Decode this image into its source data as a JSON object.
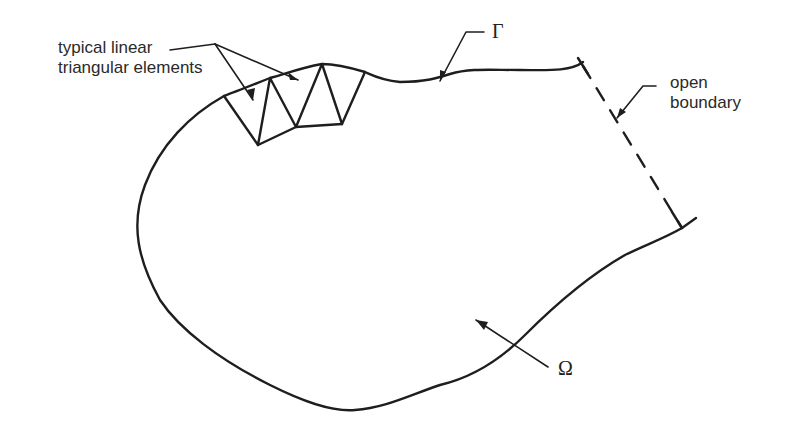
{
  "figure": {
    "labels": {
      "elements_line1": "typical linear",
      "elements_line2": "triangular elements",
      "open_line1": "open",
      "open_line2": "boundary",
      "gamma": "Γ",
      "omega": "Ω"
    },
    "colors": {
      "stroke": "#1e1e1e",
      "background": "#ffffff"
    }
  }
}
